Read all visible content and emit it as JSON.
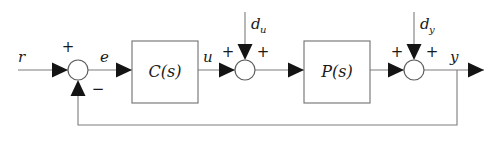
{
  "diagram": {
    "type": "control-block-diagram",
    "colors": {
      "wire": "#7d7d7d",
      "block_stroke": "#6f6f6f",
      "arrow_fill": "#141414",
      "text": "#1a1a1a",
      "background": "#ffffff"
    },
    "signals": {
      "reference": "r",
      "error": "e",
      "control": "u",
      "output": "y",
      "input_disturbance": "d",
      "input_disturbance_sub": "u",
      "output_disturbance": "d",
      "output_disturbance_sub": "y"
    },
    "blocks": [
      {
        "id": "controller",
        "label": "C(s)"
      },
      {
        "id": "plant",
        "label": "P(s)"
      }
    ],
    "summing_junctions": [
      {
        "id": "error-junction",
        "signs": {
          "left": "+",
          "bottom": "−"
        }
      },
      {
        "id": "input-disturbance-junction",
        "signs": {
          "left": "+",
          "right": "+"
        }
      },
      {
        "id": "output-disturbance-junction",
        "signs": {
          "left": "+",
          "right": "+"
        }
      }
    ]
  }
}
